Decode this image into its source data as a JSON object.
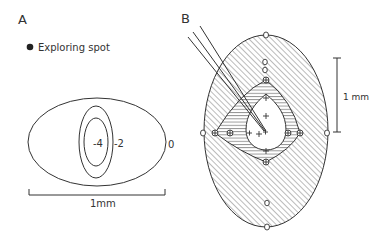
{
  "panel_a": {
    "label": "A",
    "legend": {
      "marker": "filled-circle",
      "text": "Exploring spot"
    },
    "contours": [
      {
        "label": "0",
        "level": 0
      },
      {
        "label": "-2",
        "level": -2
      },
      {
        "label": "-4",
        "level": -4
      }
    ],
    "scale_bar": {
      "label": "1mm"
    }
  },
  "panel_b": {
    "label": "B",
    "scale_bar": {
      "label": "1 mm"
    },
    "markers": {
      "open_circle": "no response",
      "plus_circle": "weak response",
      "plus": "strong response"
    }
  },
  "colors": {
    "line": "#333333",
    "background": "#ffffff"
  }
}
